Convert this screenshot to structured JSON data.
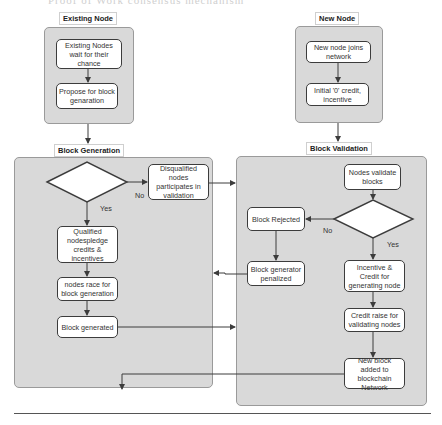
{
  "header": {
    "text": "Proof of Work consensus mechanism"
  },
  "lanes": {
    "existing_node": {
      "label": "Existing Node"
    },
    "new_node": {
      "label": "New Node"
    },
    "block_generation": {
      "label": "Block Generation"
    },
    "block_validation": {
      "label": "Block Validation"
    }
  },
  "nodes": {
    "existing_wait": "Existing Nodes wait for their chance",
    "propose": "Propose for block genaration",
    "new_joins": "New node joins network",
    "initial_credit": "Initial '0' credit, incentive",
    "credit_threshold": "Node credit > threshold?",
    "disqualified": "Disqualified nodes participates in validation",
    "qualified": "Qualified nodespledge credits & incentives",
    "race": "nodes race for block generation",
    "block_generated": "Block generated",
    "nodes_validate": "Nodes validate blocks",
    "successful_validation": "Successful validation",
    "block_rejected": "Block Rejected",
    "generator_penalized": "Block generator penalized",
    "incentive_credit": "Incentive & Credit for generating node",
    "credit_raise": "Credit raise for validating nodes",
    "new_block_added": "New block added to blockchain Network"
  },
  "edge_labels": {
    "threshold_no": "No",
    "threshold_yes": "Yes",
    "validation_no": "No",
    "validation_yes": "Yes"
  },
  "colors": {
    "lane_fill": "#d9d9d9",
    "node_fill": "#ffffff",
    "node_border": "#3c3c3c",
    "connector": "#3c3c3c"
  }
}
